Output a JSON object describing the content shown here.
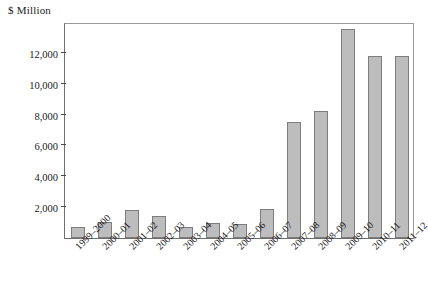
{
  "chart_data": {
    "type": "bar",
    "title": "",
    "subtitle": "",
    "xlabel": "",
    "ylabel": "$ Million",
    "unit_label": "$ Million",
    "categories": [
      "1999–2000",
      "2000–01",
      "2001–02",
      "2002–03",
      "2003–04",
      "2004–05",
      "2005–06",
      "2006–07",
      "2007–08",
      "2008–09",
      "2009–10",
      "2010–11",
      "2011–12"
    ],
    "values": [
      700,
      1050,
      1800,
      1400,
      700,
      950,
      900,
      1850,
      7550,
      8250,
      13550,
      11800,
      11800
    ],
    "ylim": [
      0,
      14000
    ],
    "yticks": [
      2000,
      4000,
      6000,
      8000,
      10000,
      12000
    ],
    "ytick_labels": [
      "2,000",
      "4,000",
      "6,000",
      "8,000",
      "10,000",
      "12,000"
    ],
    "grid": false,
    "legend": null,
    "series": [
      {
        "name": "",
        "values": [
          700,
          1050,
          1800,
          1400,
          700,
          950,
          900,
          1850,
          7550,
          8250,
          13550,
          11800,
          11800
        ]
      }
    ],
    "colors": {
      "bar_fill": "#bdbdbd",
      "bar_stroke": "#7d7d7d",
      "axis": "#4a4a4a",
      "text": "#1a1a1a",
      "background": "#ffffff"
    }
  }
}
